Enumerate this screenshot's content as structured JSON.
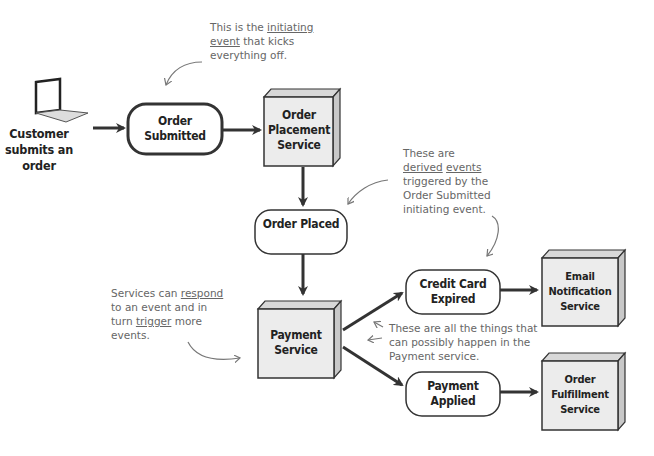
{
  "actor": {
    "icon": "laptop-icon",
    "label": "Customer submits an order"
  },
  "events": {
    "order_submitted": "Order Submitted",
    "order_placed": "Order Placed",
    "credit_card_expired": "Credit Card Expired",
    "payment_applied": "Payment Applied"
  },
  "services": {
    "order_placement": "Order Placement Service",
    "payment": "Payment Service",
    "email_notification": "Email Notification Service",
    "order_fulfillment": "Order Fulfillment Service"
  },
  "annotations": {
    "initiating": {
      "pre": "This is the ",
      "u1": "initiating",
      "mid": " ",
      "u2": "event",
      "post": " that kicks everything off."
    },
    "derived": {
      "pre": "These are ",
      "u1": "derived",
      "mid": " ",
      "u2": "events",
      "post": " triggered by the Order Submitted initiating event."
    },
    "services_respond": {
      "pre": "Services can ",
      "u1": "respond",
      "mid": " to an event and in turn ",
      "u2": "trigger",
      "post": " more events."
    },
    "payment_outcomes": "These are all the things that can possibly happen in the Payment service."
  },
  "colors": {
    "stroke": "#333333",
    "box_fill": "#ececec",
    "box_side": "#cfcfcf",
    "note": "#666666"
  }
}
